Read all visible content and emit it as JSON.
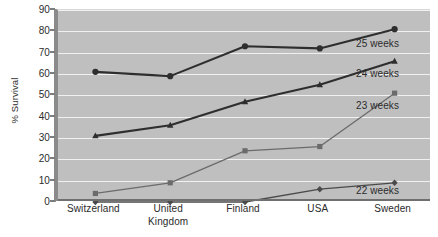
{
  "chart_data": {
    "type": "line",
    "title": "",
    "xlabel": "",
    "ylabel": "% Survival",
    "categories": [
      "Switzerland",
      "United Kingdom",
      "Finland",
      "USA",
      "Sweden"
    ],
    "category_lines": [
      [
        "Switzerland"
      ],
      [
        "United",
        "Kingdom"
      ],
      [
        "Finland"
      ],
      [
        "USA"
      ],
      [
        "Sweden"
      ]
    ],
    "ylim": [
      0,
      90
    ],
    "yticks": [
      0,
      10,
      20,
      30,
      40,
      50,
      60,
      70,
      80,
      90
    ],
    "grid": true,
    "legend_position": "inline-right",
    "plot_background": "#bfbfbf",
    "gridline_color": "#f0f0f0",
    "series": [
      {
        "name": "25 weeks",
        "marker": "circle",
        "color": "#2e2e2e",
        "line_width": 2.1,
        "values": [
          61,
          59,
          73,
          72,
          81
        ]
      },
      {
        "name": "24 weeks",
        "marker": "triangle",
        "color": "#2e2e2e",
        "line_width": 2.1,
        "values": [
          31,
          36,
          47,
          55,
          66
        ]
      },
      {
        "name": "23 weeks",
        "marker": "square",
        "color": "#6b6b6b",
        "line_width": 1.3,
        "values": [
          4,
          9,
          24,
          26,
          51
        ]
      },
      {
        "name": "22 weeks",
        "marker": "diamond",
        "color": "#4a4a4a",
        "line_width": 1.3,
        "values": [
          0,
          0,
          0,
          6,
          9
        ]
      }
    ],
    "annotations": [
      {
        "text": "25 weeks",
        "x_px": 356,
        "y_px": 38
      },
      {
        "text": "24 weeks",
        "x_px": 356,
        "y_px": 68
      },
      {
        "text": "23 weeks",
        "x_px": 356,
        "y_px": 100
      },
      {
        "text": "22 weeks",
        "x_px": 356,
        "y_px": 185
      }
    ]
  }
}
